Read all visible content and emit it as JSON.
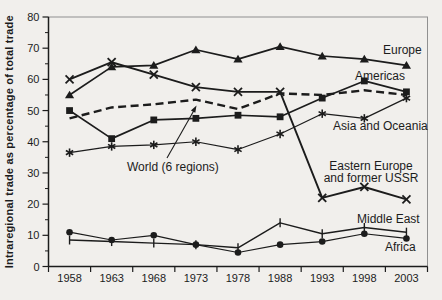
{
  "chart_data": {
    "type": "line",
    "title": "",
    "xlabel": "",
    "ylabel": "Intraregional trade as percentage of total trade",
    "ylim": [
      0,
      80
    ],
    "ytick_step": 10,
    "ytick_minor_step": 5,
    "grid": false,
    "legend_position": "inline-labels-right",
    "categories": [
      "1958",
      "1963",
      "1968",
      "1973",
      "1978",
      "1988",
      "1993",
      "1998",
      "2003"
    ],
    "series": [
      {
        "name": "Asia and Oceania",
        "marker": "star",
        "line": "solid",
        "stroke_width": 1.2,
        "values": [
          36.5,
          38.5,
          39,
          40,
          37.5,
          42.5,
          49,
          47.5,
          54
        ]
      },
      {
        "name": "Middle East",
        "marker": "vertical-tick",
        "line": "solid",
        "stroke_width": 1.4,
        "values": [
          8.5,
          8,
          7.5,
          7,
          6,
          14,
          10.5,
          12.5,
          11
        ]
      },
      {
        "name": "Africa",
        "marker": "filled-circle",
        "line": "solid",
        "stroke_width": 1.2,
        "values": [
          11,
          8.5,
          10,
          7,
          4.5,
          7,
          8,
          10.5,
          9
        ]
      },
      {
        "name": "Americas",
        "marker": "filled-square",
        "line": "solid",
        "stroke_width": 1.7,
        "values": [
          50,
          41,
          47,
          47.5,
          48.5,
          48,
          54,
          59.5,
          56
        ]
      },
      {
        "name": "Europe",
        "marker": "filled-triangle",
        "line": "solid",
        "stroke_width": 1.7,
        "values": [
          55,
          64,
          64.5,
          69.5,
          66.5,
          70.5,
          67.5,
          66.5,
          64.5
        ]
      },
      {
        "name": "Eastern Europe and former USSR",
        "marker": "x-cross",
        "line": "solid",
        "stroke_width": 1.9,
        "values": [
          60,
          65.5,
          61.5,
          57.5,
          56,
          56,
          22,
          25.5,
          21.5
        ]
      },
      {
        "name": "World (6 regions)",
        "marker": "none",
        "line": "dashed",
        "stroke_width": 2.4,
        "values": [
          47.5,
          51,
          52,
          53.5,
          50.5,
          55.5,
          55,
          56.5,
          55
        ]
      }
    ],
    "annotations": [
      {
        "text": "World (6 regions)",
        "points_to": "dashed World line near 1973"
      }
    ]
  },
  "axis": {
    "ylabel": "Intraregional trade as percentage of total trade",
    "yticks": [
      "0",
      "10",
      "20",
      "30",
      "40",
      "50",
      "60",
      "70",
      "80"
    ],
    "xticks": [
      "1958",
      "1963",
      "1968",
      "1973",
      "1978",
      "1988",
      "1993",
      "1998",
      "2003"
    ]
  },
  "labels": {
    "europe": [
      "Europe"
    ],
    "americas": [
      "Americas"
    ],
    "asia_and_oceania": [
      "Asia and Oceania"
    ],
    "eastern_europe": [
      "Eastern Europe",
      "and former USSR"
    ],
    "world": [
      "World (6 regions)"
    ],
    "middle_east": [
      "Middle East"
    ],
    "africa": [
      "Africa"
    ]
  },
  "colors": {
    "ink": "#1c1c1c",
    "frame": "#909090",
    "background": "#f1efec"
  }
}
